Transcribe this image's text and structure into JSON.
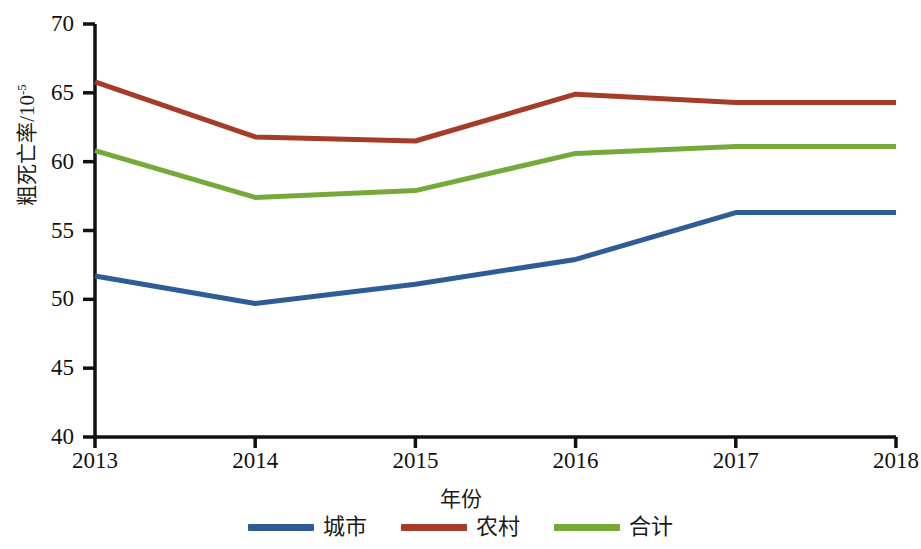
{
  "chart_data": {
    "type": "line",
    "title": "",
    "subtitle": "",
    "xlabel": "年份",
    "ylabel": "粗死亡率/10⁻⁵",
    "ylabel_base": "粗死亡率/10",
    "ylabel_exponent": "-5",
    "x": [
      "2013",
      "2014",
      "2015",
      "2016",
      "2017",
      "2018"
    ],
    "categories": [
      "2013",
      "2014",
      "2015",
      "2016",
      "2017",
      "2018"
    ],
    "xlim": [
      2013,
      2018
    ],
    "ylim": [
      40,
      70
    ],
    "ytick_values": [
      70,
      65,
      60,
      55,
      50,
      45,
      40
    ],
    "ytick_labels": [
      "70",
      "65",
      "60",
      "55",
      "50",
      "45",
      "40"
    ],
    "xtick_labels": [
      "2013",
      "2014",
      "2015",
      "2016",
      "2017",
      "2018"
    ],
    "grid": false,
    "legend_position": "bottom",
    "series": [
      {
        "name": "城市",
        "color": "#2E5C96",
        "values": [
          51.7,
          49.7,
          51.1,
          52.9,
          56.3,
          56.3
        ]
      },
      {
        "name": "农村",
        "color": "#A53C28",
        "values": [
          65.8,
          61.8,
          61.5,
          64.9,
          64.3,
          64.3
        ]
      },
      {
        "name": "合计",
        "color": "#76A939",
        "values": [
          60.8,
          57.4,
          57.9,
          60.6,
          61.1,
          61.1
        ]
      }
    ]
  },
  "axis": {
    "x_title": "年份",
    "y_title_base": "粗死亡率/10",
    "y_title_exponent": "-5",
    "y_ticks": [
      "70",
      "65",
      "60",
      "55",
      "50",
      "45",
      "40"
    ],
    "x_ticks": [
      "2013",
      "2014",
      "2015",
      "2016",
      "2017",
      "2018"
    ],
    "axis_color": "#111111"
  },
  "legend": {
    "items": [
      {
        "label": "城市",
        "color": "#2E5C96"
      },
      {
        "label": "农村",
        "color": "#A53C28"
      },
      {
        "label": "合计",
        "color": "#76A939"
      }
    ]
  }
}
